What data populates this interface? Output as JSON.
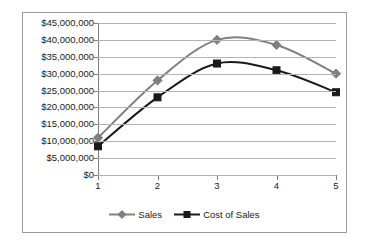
{
  "chart_data": {
    "type": "line",
    "title": "",
    "subtitle": "",
    "xlabel": "",
    "ylabel": "",
    "categories": [
      "1",
      "2",
      "3",
      "4",
      "5"
    ],
    "ylim": [
      0,
      45000000
    ],
    "ytick_values": [
      0,
      5000000,
      10000000,
      15000000,
      20000000,
      25000000,
      30000000,
      35000000,
      40000000,
      45000000
    ],
    "ytick_labels": [
      "$0",
      "$5,000,000",
      "$10,000,000",
      "$15,000,000",
      "$20,000,000",
      "$25,000,000",
      "$30,000,000",
      "$35,000,000",
      "$40,000,000",
      "$45,000,000"
    ],
    "grid": true,
    "grid_axis": "y",
    "smooth": true,
    "legend_position": "bottom",
    "series": [
      {
        "name": "Sales",
        "color": "#808080",
        "marker": "diamond",
        "values": [
          11000000,
          28000000,
          40000000,
          38500000,
          30000000
        ]
      },
      {
        "name": "Cost of Sales",
        "color": "#1a1a1a",
        "marker": "square",
        "values": [
          8500000,
          23000000,
          33000000,
          31000000,
          24500000
        ]
      }
    ]
  },
  "legend": {
    "entries": [
      {
        "label": "Sales"
      },
      {
        "label": "Cost of Sales"
      }
    ]
  },
  "colors": {
    "sales": "#808080",
    "cost_of_sales": "#1a1a1a",
    "gridline": "#b4b4b4",
    "axis": "#7d7d7d",
    "border": "#9a9a9a",
    "background": "#ffffff"
  }
}
